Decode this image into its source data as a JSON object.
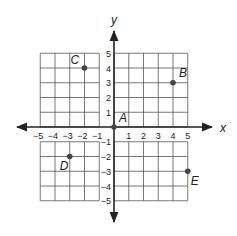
{
  "chart_data": {
    "type": "scatter",
    "title": "",
    "xlabel": "x",
    "ylabel": "y",
    "xlim": [
      -5,
      5
    ],
    "ylim": [
      -5,
      5
    ],
    "grid": true,
    "x_ticks": [
      "-5",
      "-4",
      "-3",
      "-2",
      "-1",
      "1",
      "2",
      "3",
      "4",
      "5"
    ],
    "y_ticks": [
      "5",
      "4",
      "3",
      "2",
      "1",
      "-1",
      "-2",
      "-3",
      "-4",
      "-5"
    ],
    "points": [
      {
        "label": "A",
        "x": 0,
        "y": 0
      },
      {
        "label": "B",
        "x": 4,
        "y": 3
      },
      {
        "label": "C",
        "x": -2,
        "y": 4
      },
      {
        "label": "D",
        "x": -3,
        "y": -2
      },
      {
        "label": "E",
        "x": 5,
        "y": -3
      }
    ]
  },
  "colors": {
    "grid": "#555555",
    "axis": "#222222",
    "point": "#444444"
  }
}
